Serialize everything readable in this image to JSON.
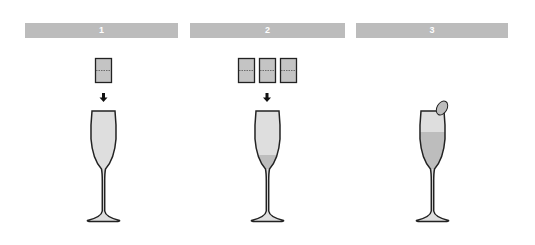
{
  "steps": [
    {
      "number": "1",
      "cubes": 1,
      "liquid_level": "none",
      "garnish": false
    },
    {
      "number": "2",
      "cubes": 3,
      "liquid_level": "low",
      "garnish": false
    },
    {
      "number": "3",
      "cubes": 0,
      "liquid_level": "high",
      "garnish": true
    }
  ],
  "colors": {
    "bar": "#bcbcbc",
    "bar_text": "#ffffff",
    "glass_fill": "#dedede",
    "liquid_fill": "#bdbdbd",
    "cube_fill": "#c4c4c4",
    "outline": "#222222"
  }
}
